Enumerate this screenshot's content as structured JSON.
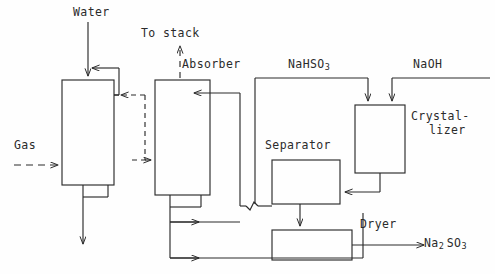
{
  "diagram": {
    "type": "process-flow-diagram",
    "stroke_color": "#2b2b2b",
    "background_color": "#fefefe",
    "labels": {
      "water": "Water",
      "to_stack": "To stack",
      "absorber": "Absorber",
      "nahso3": "NaHSO",
      "nahso3_sub": "3",
      "naoh": "NaOH",
      "crystallizer_line1": "Crystal-",
      "crystallizer_line2": "lizer",
      "gas": "Gas",
      "separator": "Separator",
      "dryer": "Dryer",
      "product": "Na",
      "product_sub1": "2",
      "product_mid": "SO",
      "product_sub2": "3"
    },
    "units": [
      {
        "name": "prescrubber-tower",
        "x": 62,
        "y": 80,
        "w": 52,
        "h": 105
      },
      {
        "name": "absorber-tower",
        "x": 155,
        "y": 80,
        "w": 55,
        "h": 115
      },
      {
        "name": "separator-vessel",
        "x": 272,
        "y": 160,
        "w": 68,
        "h": 44
      },
      {
        "name": "crystallizer-vessel",
        "x": 355,
        "y": 105,
        "w": 50,
        "h": 68
      },
      {
        "name": "dryer-vessel",
        "x": 272,
        "y": 230,
        "w": 80,
        "h": 30
      }
    ],
    "streams": [
      {
        "name": "water-feed",
        "style": "solid",
        "to": "prescrubber-tower"
      },
      {
        "name": "gas-feed",
        "style": "dashed",
        "to": "prescrubber-tower"
      },
      {
        "name": "gas-to-absorber",
        "style": "dashed",
        "to": "absorber-tower"
      },
      {
        "name": "to-stack-vent",
        "style": "dashed",
        "from": "absorber-tower"
      },
      {
        "name": "prescrubber-blowdown",
        "style": "solid",
        "from": "prescrubber-tower"
      },
      {
        "name": "nahso3-recycle-to-crystallizer",
        "style": "solid"
      },
      {
        "name": "naoh-feed",
        "style": "solid",
        "to": "crystallizer-vessel"
      },
      {
        "name": "crystallizer-slurry-to-separator",
        "style": "solid"
      },
      {
        "name": "separator-liquor-recycle",
        "style": "solid"
      },
      {
        "name": "absorber-bottoms-recycle",
        "style": "solid"
      },
      {
        "name": "separator-cake-to-dryer",
        "style": "solid"
      },
      {
        "name": "dryer-product-out",
        "style": "solid"
      }
    ]
  }
}
